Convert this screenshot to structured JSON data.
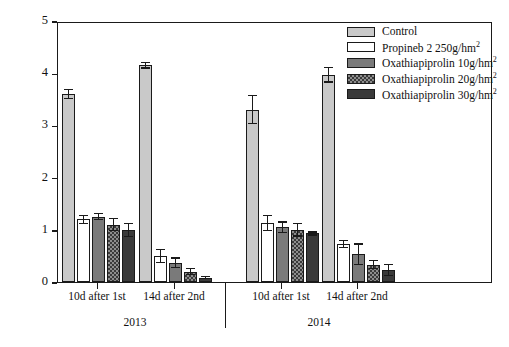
{
  "chart_data": {
    "type": "bar",
    "title": "",
    "xlabel": "",
    "ylabel": "Disease severity",
    "ylim": [
      0,
      5
    ],
    "yticks": [
      0,
      1,
      2,
      3,
      4,
      5
    ],
    "grid": false,
    "legend_position": "top-right",
    "categories": [
      "10d after 1st",
      "14d after 2nd",
      "10d after 1st",
      "14d after 2nd"
    ],
    "group_labels": [
      "2013",
      "2014"
    ],
    "series": [
      {
        "name": "Control",
        "values": [
          3.6,
          4.15,
          3.3,
          3.97
        ],
        "errors": [
          0.1,
          0.06,
          0.28,
          0.15
        ],
        "color": "#c9c9c9",
        "pattern": "solid-light-gray"
      },
      {
        "name": "Propineb 2 250g/hm2",
        "values": [
          1.2,
          0.5,
          1.13,
          0.73
        ],
        "errors": [
          0.09,
          0.14,
          0.15,
          0.08
        ],
        "color": "#ffffff",
        "pattern": "white"
      },
      {
        "name": "Oxathiapiprolin 10g/hm2",
        "values": [
          1.25,
          0.37,
          1.05,
          0.53
        ],
        "errors": [
          0.07,
          0.1,
          0.11,
          0.21
        ],
        "color": "#7a7a7a",
        "pattern": "solid-mid-gray"
      },
      {
        "name": "Oxathiapiprolin 20g/hm2",
        "values": [
          1.1,
          0.2,
          1.0,
          0.33
        ],
        "errors": [
          0.13,
          0.07,
          0.13,
          0.09
        ],
        "color": "#8d8d8d",
        "pattern": "checkered"
      },
      {
        "name": "Oxathiapiprolin 30g/hm2",
        "values": [
          1.0,
          0.08,
          0.93,
          0.23
        ],
        "errors": [
          0.14,
          0.03,
          0.04,
          0.12
        ],
        "color": "#3a3a3a",
        "pattern": "solid-dark"
      }
    ]
  },
  "axis": {
    "y_label": "Disease severity",
    "y_ticks": [
      "0",
      "1",
      "2",
      "3",
      "4",
      "5"
    ],
    "x_labels": [
      "10d after 1st",
      "14d after 2nd",
      "10d after 1st",
      "14d after 2nd"
    ],
    "year_labels": [
      "2013",
      "2014"
    ]
  },
  "legend": {
    "items": [
      {
        "label": "Control",
        "sup": ""
      },
      {
        "label": "Propineb 2 250g/hm",
        "sup": "2"
      },
      {
        "label": "Oxathiapiprolin 10g/hm",
        "sup": "2"
      },
      {
        "label": "Oxathiapiprolin 20g/hm",
        "sup": "2"
      },
      {
        "label": "Oxathiapiprolin 30g/hm",
        "sup": "2"
      }
    ]
  }
}
